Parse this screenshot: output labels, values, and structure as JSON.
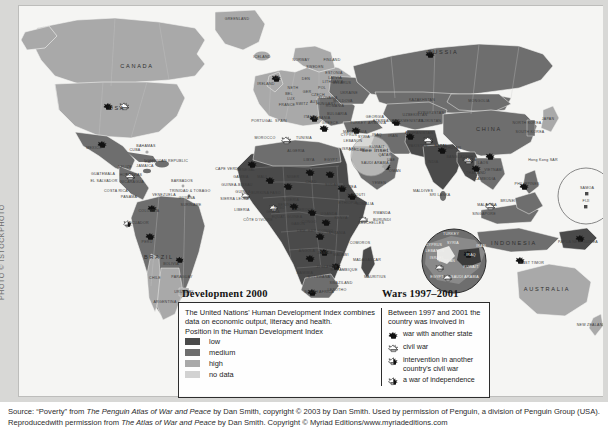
{
  "photo_credit": "PHOTO © ISTOCKPHOTO",
  "map": {
    "see_inset_label": "see inset",
    "ocean_color": "#f5f5f3",
    "regions_big": [
      {
        "name": "CANADA",
        "x": 118,
        "y": 62
      },
      {
        "name": "USA",
        "x": 98,
        "y": 104
      },
      {
        "name": "RUSSIA",
        "x": 424,
        "y": 48
      },
      {
        "name": "CHINA",
        "x": 470,
        "y": 125
      },
      {
        "name": "BRAZIL",
        "x": 140,
        "y": 253
      },
      {
        "name": "AUSTRALIA",
        "x": 528,
        "y": 285
      },
      {
        "name": "INDONESIA",
        "x": 495,
        "y": 239
      }
    ],
    "labels": [
      {
        "name": "GREENLAND",
        "x": 218,
        "y": 14
      },
      {
        "name": "ICELAND",
        "x": 243,
        "y": 52
      },
      {
        "name": "NORWAY",
        "x": 282,
        "y": 55
      },
      {
        "name": "SWEDEN",
        "x": 296,
        "y": 62
      },
      {
        "name": "FINLAND",
        "x": 313,
        "y": 55
      },
      {
        "name": "IRELAND",
        "x": 247,
        "y": 79
      },
      {
        "name": "UK",
        "x": 258,
        "y": 73
      },
      {
        "name": "DEN",
        "x": 287,
        "y": 74
      },
      {
        "name": "NETH",
        "x": 274,
        "y": 83
      },
      {
        "name": "BEL",
        "x": 270,
        "y": 89
      },
      {
        "name": "LUX",
        "x": 272,
        "y": 94
      },
      {
        "name": "GER",
        "x": 288,
        "y": 87
      },
      {
        "name": "POL",
        "x": 303,
        "y": 83
      },
      {
        "name": "FRANCE",
        "x": 268,
        "y": 100
      },
      {
        "name": "SWITZ",
        "x": 283,
        "y": 99
      },
      {
        "name": "AUS",
        "x": 295,
        "y": 97
      },
      {
        "name": "CZECH",
        "x": 299,
        "y": 90
      },
      {
        "name": "SLOVAKIA",
        "x": 309,
        "y": 93
      },
      {
        "name": "HUNGARY",
        "x": 307,
        "y": 99
      },
      {
        "name": "PORTUGAL",
        "x": 243,
        "y": 116
      },
      {
        "name": "SPAIN",
        "x": 262,
        "y": 116
      },
      {
        "name": "ITALY",
        "x": 290,
        "y": 112
      },
      {
        "name": "MOROCCO",
        "x": 246,
        "y": 133
      },
      {
        "name": "ALGERIA",
        "x": 277,
        "y": 146
      },
      {
        "name": "BELARUS",
        "x": 323,
        "y": 78
      },
      {
        "name": "UKRAINE",
        "x": 330,
        "y": 88
      },
      {
        "name": "MOLDOVA",
        "x": 324,
        "y": 96
      },
      {
        "name": "ROMANIA",
        "x": 316,
        "y": 101
      },
      {
        "name": "BULGARIA",
        "x": 318,
        "y": 109
      },
      {
        "name": "GREECE",
        "x": 311,
        "y": 118
      },
      {
        "name": "MACEDONIA",
        "x": 336,
        "y": 127
      },
      {
        "name": "ALBANIA",
        "x": 303,
        "y": 113
      },
      {
        "name": "ESTONIA",
        "x": 315,
        "y": 68
      },
      {
        "name": "LATVIA",
        "x": 316,
        "y": 73
      },
      {
        "name": "LITHUANIA",
        "x": 314,
        "y": 77
      },
      {
        "name": "TURKEY",
        "x": 339,
        "y": 118
      },
      {
        "name": "GEORGIA",
        "x": 356,
        "y": 112
      },
      {
        "name": "ARMENIA",
        "x": 358,
        "y": 118
      },
      {
        "name": "AZERBAIJAN",
        "x": 366,
        "y": 116
      },
      {
        "name": "KAZAKHSTAN",
        "x": 403,
        "y": 95
      },
      {
        "name": "UZBEKISTAN",
        "x": 396,
        "y": 110
      },
      {
        "name": "TURKMENISTAN",
        "x": 389,
        "y": 116
      },
      {
        "name": "KYRGYZSTAN",
        "x": 412,
        "y": 108
      },
      {
        "name": "TAJIKISTAN",
        "x": 411,
        "y": 116
      },
      {
        "name": "MONGOLIA",
        "x": 460,
        "y": 96
      },
      {
        "name": "NORTH KOREA",
        "x": 508,
        "y": 118
      },
      {
        "name": "SOUTH KOREA",
        "x": 511,
        "y": 127
      },
      {
        "name": "JAPAN",
        "x": 529,
        "y": 114
      },
      {
        "name": "AFGHANISTAN",
        "x": 400,
        "y": 128
      },
      {
        "name": "PAKISTAN",
        "x": 399,
        "y": 141
      },
      {
        "name": "IRAN",
        "x": 374,
        "y": 131
      },
      {
        "name": "IRAQ",
        "x": 358,
        "y": 130
      },
      {
        "name": "INDIA",
        "x": 414,
        "y": 157
      },
      {
        "name": "NEPAL",
        "x": 422,
        "y": 141
      },
      {
        "name": "BHUTAN",
        "x": 434,
        "y": 143
      },
      {
        "name": "BANGLADESH",
        "x": 441,
        "y": 152
      },
      {
        "name": "BURMA",
        "x": 450,
        "y": 155
      },
      {
        "name": "SRI LANKA",
        "x": 421,
        "y": 190
      },
      {
        "name": "MALDIVES",
        "x": 404,
        "y": 186
      },
      {
        "name": "NEPAL",
        "x": 422,
        "y": 141
      },
      {
        "name": "THAILAND",
        "x": 457,
        "y": 168
      },
      {
        "name": "LAOS",
        "x": 464,
        "y": 158
      },
      {
        "name": "VIETNAM",
        "x": 474,
        "y": 165
      },
      {
        "name": "CAMBODIA",
        "x": 466,
        "y": 174
      },
      {
        "name": "MALAYSIA",
        "x": 468,
        "y": 200
      },
      {
        "name": "BRUNEI",
        "x": 489,
        "y": 196
      },
      {
        "name": "SINGAPORE",
        "x": 465,
        "y": 209
      },
      {
        "name": "PHILIPPINES",
        "x": 508,
        "y": 179
      },
      {
        "name": "EAST TIMOR",
        "x": 513,
        "y": 258
      },
      {
        "name": "PAPUA NEW GUINEA",
        "x": 559,
        "y": 237
      },
      {
        "name": "NEW ZEALAND",
        "x": 572,
        "y": 320
      },
      {
        "name": "Hong Kong SAR",
        "x": 524,
        "y": 155
      },
      {
        "name": "SAMOA",
        "x": 568,
        "y": 183
      },
      {
        "name": "FIJI",
        "x": 567,
        "y": 196
      },
      {
        "name": "MEXICO",
        "x": 75,
        "y": 143
      },
      {
        "name": "BAHAMAS",
        "x": 127,
        "y": 141
      },
      {
        "name": "CUBA",
        "x": 116,
        "y": 145
      },
      {
        "name": "HAITI",
        "x": 131,
        "y": 157
      },
      {
        "name": "DOMINICAN REPUBLIC",
        "x": 147,
        "y": 156
      },
      {
        "name": "JAMAICA",
        "x": 126,
        "y": 161
      },
      {
        "name": "BELIZE",
        "x": 106,
        "y": 162
      },
      {
        "name": "GUATEMALA",
        "x": 84,
        "y": 169
      },
      {
        "name": "HONDURAS",
        "x": 112,
        "y": 170
      },
      {
        "name": "EL SALVADOR",
        "x": 85,
        "y": 176
      },
      {
        "name": "NICARAGUA",
        "x": 113,
        "y": 177
      },
      {
        "name": "COSTA RICA",
        "x": 97,
        "y": 186
      },
      {
        "name": "PANAMA",
        "x": 110,
        "y": 192
      },
      {
        "name": "BARBADOS",
        "x": 163,
        "y": 176
      },
      {
        "name": "TRINIDAD & TOBAGO",
        "x": 171,
        "y": 186
      },
      {
        "name": "VENEZUELA",
        "x": 145,
        "y": 190
      },
      {
        "name": "GUYANA",
        "x": 168,
        "y": 193
      },
      {
        "name": "SURINAME",
        "x": 172,
        "y": 200
      },
      {
        "name": "COLOMBIA",
        "x": 130,
        "y": 206
      },
      {
        "name": "ECUADOR",
        "x": 120,
        "y": 218
      },
      {
        "name": "PERU",
        "x": 128,
        "y": 237
      },
      {
        "name": "BOLIVIA",
        "x": 152,
        "y": 259
      },
      {
        "name": "PARAGUAY",
        "x": 163,
        "y": 272
      },
      {
        "name": "CHILE",
        "x": 136,
        "y": 273
      },
      {
        "name": "URUGUAY",
        "x": 165,
        "y": 287
      },
      {
        "name": "ARGENTINA",
        "x": 146,
        "y": 297
      },
      {
        "name": "SENEGAL",
        "x": 227,
        "y": 165
      },
      {
        "name": "GAMBIA",
        "x": 222,
        "y": 172
      },
      {
        "name": "CAPE VERDE",
        "x": 209,
        "y": 164
      },
      {
        "name": "GUINEA-BISSAU",
        "x": 218,
        "y": 180
      },
      {
        "name": "GUINEA",
        "x": 224,
        "y": 187
      },
      {
        "name": "SIERRA LEONE",
        "x": 216,
        "y": 194
      },
      {
        "name": "LIBERIA",
        "x": 223,
        "y": 205
      },
      {
        "name": "CÔTE D'IVOIRE",
        "x": 239,
        "y": 215
      },
      {
        "name": "GHANA",
        "x": 254,
        "y": 207
      },
      {
        "name": "TOGO",
        "x": 260,
        "y": 203
      },
      {
        "name": "BENIN",
        "x": 265,
        "y": 200
      },
      {
        "name": "BURKINA FASO",
        "x": 247,
        "y": 188
      },
      {
        "name": "MALI",
        "x": 243,
        "y": 172
      },
      {
        "name": "NIGER",
        "x": 274,
        "y": 172
      },
      {
        "name": "NIGERIA",
        "x": 272,
        "y": 195
      },
      {
        "name": "CAMEROON",
        "x": 283,
        "y": 205
      },
      {
        "name": "EQUAT. GUINEA",
        "x": 268,
        "y": 212
      },
      {
        "name": "GABON",
        "x": 279,
        "y": 219
      },
      {
        "name": "CONGO",
        "x": 290,
        "y": 217
      },
      {
        "name": "CHAD",
        "x": 292,
        "y": 177
      },
      {
        "name": "LIBYA",
        "x": 290,
        "y": 155
      },
      {
        "name": "EGYPT",
        "x": 312,
        "y": 155
      },
      {
        "name": "SUDAN",
        "x": 313,
        "y": 180
      },
      {
        "name": "ERITREA",
        "x": 329,
        "y": 182
      },
      {
        "name": "DJIBOUTI",
        "x": 337,
        "y": 190
      },
      {
        "name": "ETHIOPIA",
        "x": 329,
        "y": 198
      },
      {
        "name": "SOMALIA",
        "x": 346,
        "y": 199
      },
      {
        "name": "KENYA",
        "x": 322,
        "y": 213
      },
      {
        "name": "UGANDA",
        "x": 310,
        "y": 209
      },
      {
        "name": "RWANDA",
        "x": 363,
        "y": 208
      },
      {
        "name": "BURUNDI",
        "x": 363,
        "y": 215
      },
      {
        "name": "TANZANIA",
        "x": 317,
        "y": 228
      },
      {
        "name": "DEM. REP. CONGO",
        "x": 296,
        "y": 226
      },
      {
        "name": "ANGOLA",
        "x": 288,
        "y": 246
      },
      {
        "name": "ZAMBIA",
        "x": 306,
        "y": 248
      },
      {
        "name": "MALAWI",
        "x": 322,
        "y": 250
      },
      {
        "name": "MOZAMBIQUE",
        "x": 325,
        "y": 265
      },
      {
        "name": "ZIMBABWE",
        "x": 308,
        "y": 262
      },
      {
        "name": "BOTSWANA",
        "x": 300,
        "y": 272
      },
      {
        "name": "NAMIBIA",
        "x": 286,
        "y": 268
      },
      {
        "name": "SOUTH AFRICA",
        "x": 300,
        "y": 287
      },
      {
        "name": "SWAZILAND",
        "x": 322,
        "y": 278
      },
      {
        "name": "LESOTHO",
        "x": 318,
        "y": 285
      },
      {
        "name": "MADAGASCAR",
        "x": 348,
        "y": 255
      },
      {
        "name": "COMOROS",
        "x": 341,
        "y": 238
      },
      {
        "name": "MAURITIUS",
        "x": 356,
        "y": 272
      },
      {
        "name": "SEYCHELLES",
        "x": 352,
        "y": 218
      },
      {
        "name": "TUNISIA",
        "x": 285,
        "y": 133
      },
      {
        "name": "CYPRUS",
        "x": 330,
        "y": 130
      },
      {
        "name": "LEBANON",
        "x": 334,
        "y": 136
      },
      {
        "name": "ISRAEL",
        "x": 330,
        "y": 144
      },
      {
        "name": "JORDAN",
        "x": 338,
        "y": 145
      },
      {
        "name": "SYRIA",
        "x": 345,
        "y": 132
      },
      {
        "name": "SAUDI ARABIA",
        "x": 356,
        "y": 158
      },
      {
        "name": "YEMEN",
        "x": 360,
        "y": 178
      },
      {
        "name": "OMAN",
        "x": 376,
        "y": 166
      },
      {
        "name": "UAE",
        "x": 372,
        "y": 155
      },
      {
        "name": "QATAR",
        "x": 366,
        "y": 150
      },
      {
        "name": "KUWAIT",
        "x": 358,
        "y": 142
      }
    ],
    "inset_middle_east": {
      "cx": 435,
      "cy": 255,
      "r": 32,
      "labels": [
        {
          "name": "TURKEY",
          "x": 432,
          "y": 229
        },
        {
          "name": "CYPRUS",
          "x": 415,
          "y": 240
        },
        {
          "name": "SYRIA",
          "x": 434,
          "y": 238
        },
        {
          "name": "LEBANON",
          "x": 416,
          "y": 246
        },
        {
          "name": "ISRAEL",
          "x": 418,
          "y": 253
        },
        {
          "name": "JORDAN",
          "x": 428,
          "y": 256
        },
        {
          "name": "IRAQ",
          "x": 452,
          "y": 250
        },
        {
          "name": "IRAN",
          "x": 462,
          "y": 241
        },
        {
          "name": "KUWAIT",
          "x": 452,
          "y": 262
        },
        {
          "name": "SAUDI ARABIA",
          "x": 446,
          "y": 272
        },
        {
          "name": "EGYPT",
          "x": 418,
          "y": 272
        }
      ]
    },
    "inset_pacific": {
      "cx": 567,
      "cy": 190,
      "r": 28
    }
  },
  "legend": {
    "development": {
      "title": "Development 2000",
      "description": "The United Nations' Human Development Index combines data on economic output, literacy and health.",
      "scale_heading": "Position in the Human Development Index",
      "items": [
        {
          "label": "low",
          "color": "#4a4a4a"
        },
        {
          "label": "medium",
          "color": "#6e6e6e"
        },
        {
          "label": "high",
          "color": "#a9a9a9"
        },
        {
          "label": "no data",
          "color": "#d2d2d2"
        }
      ]
    },
    "wars": {
      "title": "Wars 1997–2001",
      "description": "Between 1997 and 2001 the country was involved in",
      "items": [
        {
          "label": "war with another state",
          "icon": "blast-filled-icon"
        },
        {
          "label": "civil war",
          "icon": "blast-outline-icon"
        },
        {
          "label": "intervention in another country's civil war",
          "icon": "blast-half-icon"
        },
        {
          "label": "a war of independence",
          "icon": "blast-hatched-icon"
        }
      ]
    }
  },
  "caption": {
    "line1_a": "Source: “Poverty” from ",
    "line1_italic": "The Penguin Atlas of War and Peace",
    "line1_b": " by Dan Smith, copyright © 2003 by Dan Smith. Used by permission of Penguin, a division of Penguin Group (USA). Reproduced",
    "line2_a": "with permission from ",
    "line2_italic": "The Atlas of War and Peace",
    "line2_b": " by Dan Smith. Copyright © Myriad Editions/www.myriadeditions.com"
  }
}
